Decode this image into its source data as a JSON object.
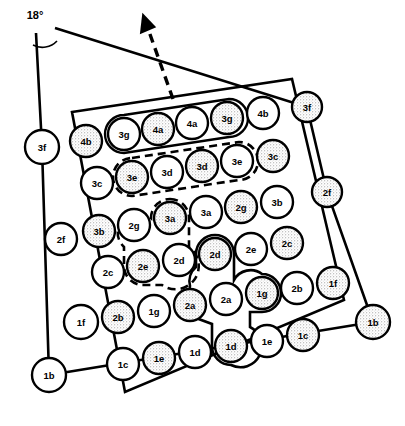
{
  "figure": {
    "annotations": {
      "angle_label": "18°",
      "angle_arc": "arc-between-frame-lines",
      "direction_arrow": "dashed-arrow-up-left"
    },
    "frame_nodes": [
      {
        "id": "frame-3f-left",
        "label": "3f",
        "cx": 42,
        "cy": 147,
        "r": 17,
        "shaded": false
      },
      {
        "id": "frame-2f-left",
        "label": "2f",
        "cx": 61,
        "cy": 239,
        "r": 16,
        "shaded": false
      },
      {
        "id": "frame-1b-left",
        "label": "1b",
        "cx": 49,
        "cy": 375,
        "r": 17,
        "shaded": false
      },
      {
        "id": "frame-3f-right",
        "label": "3f",
        "cx": 307,
        "cy": 107,
        "r": 15,
        "shaded": true
      },
      {
        "id": "frame-2f-right",
        "label": "2f",
        "cx": 327,
        "cy": 192,
        "r": 15,
        "shaded": true
      },
      {
        "id": "frame-1b-right",
        "label": "1b",
        "cx": 373,
        "cy": 322,
        "r": 17,
        "shaded": true
      }
    ],
    "grid_rows": [
      {
        "row": 1,
        "cells": [
          {
            "label": "4b",
            "cx": 86,
            "cy": 141,
            "r": 16,
            "shaded": true,
            "group": null
          },
          {
            "label": "3g",
            "cx": 124,
            "cy": 134,
            "r": 16,
            "shaded": false,
            "group": "solid-top"
          },
          {
            "label": "4a",
            "cx": 158,
            "cy": 129,
            "r": 16,
            "shaded": true,
            "group": "solid-top"
          },
          {
            "label": "4a",
            "cx": 192,
            "cy": 123,
            "r": 16,
            "shaded": false,
            "group": "solid-top"
          },
          {
            "label": "3g",
            "cx": 227,
            "cy": 118,
            "r": 16,
            "shaded": true,
            "group": "solid-top"
          },
          {
            "label": "4b",
            "cx": 263,
            "cy": 113,
            "r": 16,
            "shaded": false,
            "group": null
          }
        ]
      },
      {
        "row": 2,
        "cells": [
          {
            "label": "3c",
            "cx": 97,
            "cy": 183,
            "r": 16,
            "shaded": false,
            "group": null
          },
          {
            "label": "3e",
            "cx": 132,
            "cy": 177,
            "r": 16,
            "shaded": true,
            "group": "dashed-row2"
          },
          {
            "label": "3d",
            "cx": 167,
            "cy": 172,
            "r": 16,
            "shaded": false,
            "group": "dashed-row2"
          },
          {
            "label": "3d",
            "cx": 202,
            "cy": 166,
            "r": 16,
            "shaded": true,
            "group": "dashed-row2"
          },
          {
            "label": "3e",
            "cx": 237,
            "cy": 161,
            "r": 16,
            "shaded": false,
            "group": "dashed-row2"
          },
          {
            "label": "3c",
            "cx": 273,
            "cy": 156,
            "r": 16,
            "shaded": true,
            "group": null
          }
        ]
      },
      {
        "row": 3,
        "cells": [
          {
            "label": "3b",
            "cx": 99,
            "cy": 231,
            "r": 16,
            "shaded": true,
            "group": null
          },
          {
            "label": "2g",
            "cx": 134,
            "cy": 225,
            "r": 16,
            "shaded": false,
            "group": null
          },
          {
            "label": "3a",
            "cx": 170,
            "cy": 218,
            "r": 16,
            "shaded": true,
            "group": "dashed-mid"
          },
          {
            "label": "3a",
            "cx": 206,
            "cy": 212,
            "r": 16,
            "shaded": false,
            "group": null
          },
          {
            "label": "2g",
            "cx": 241,
            "cy": 207,
            "r": 16,
            "shaded": true,
            "group": null
          },
          {
            "label": "3b",
            "cx": 277,
            "cy": 202,
            "r": 16,
            "shaded": false,
            "group": null
          }
        ]
      },
      {
        "row": 4,
        "cells": [
          {
            "label": "2c",
            "cx": 108,
            "cy": 272,
            "r": 16,
            "shaded": false,
            "group": null
          },
          {
            "label": "2e",
            "cx": 143,
            "cy": 266,
            "r": 16,
            "shaded": true,
            "group": "dashed-mid"
          },
          {
            "label": "2d",
            "cx": 179,
            "cy": 260,
            "r": 16,
            "shaded": false,
            "group": null
          },
          {
            "label": "2d",
            "cx": 215,
            "cy": 254,
            "r": 16,
            "shaded": true,
            "group": "solid-cross"
          },
          {
            "label": "2e",
            "cx": 251,
            "cy": 249,
            "r": 16,
            "shaded": false,
            "group": null
          },
          {
            "label": "2c",
            "cx": 287,
            "cy": 243,
            "r": 16,
            "shaded": true,
            "group": null
          }
        ]
      },
      {
        "row": 5,
        "cells": [
          {
            "label": "1f",
            "cx": 81,
            "cy": 322,
            "r": 17,
            "shaded": false,
            "group": null
          },
          {
            "label": "2b",
            "cx": 118,
            "cy": 317,
            "r": 16,
            "shaded": true,
            "group": null
          },
          {
            "label": "1g",
            "cx": 154,
            "cy": 311,
            "r": 16,
            "shaded": false,
            "group": null
          },
          {
            "label": "2a",
            "cx": 190,
            "cy": 305,
            "r": 16,
            "shaded": true,
            "group": "solid-cross"
          },
          {
            "label": "2a",
            "cx": 226,
            "cy": 299,
            "r": 16,
            "shaded": false,
            "group": null
          },
          {
            "label": "1g",
            "cx": 262,
            "cy": 293,
            "r": 16,
            "shaded": true,
            "group": "solid-cross"
          },
          {
            "label": "2b",
            "cx": 297,
            "cy": 288,
            "r": 16,
            "shaded": false,
            "group": null
          },
          {
            "label": "1f",
            "cx": 333,
            "cy": 283,
            "r": 16,
            "shaded": true,
            "group": null
          }
        ]
      },
      {
        "row": 6,
        "cells": [
          {
            "label": "1c",
            "cx": 123,
            "cy": 364,
            "r": 16,
            "shaded": false,
            "group": null
          },
          {
            "label": "1e",
            "cx": 159,
            "cy": 358,
            "r": 16,
            "shaded": true,
            "group": null
          },
          {
            "label": "1d",
            "cx": 195,
            "cy": 352,
            "r": 16,
            "shaded": false,
            "group": null
          },
          {
            "label": "1d",
            "cx": 231,
            "cy": 346,
            "r": 16,
            "shaded": true,
            "group": "solid-cross"
          },
          {
            "label": "1e",
            "cx": 267,
            "cy": 341,
            "r": 16,
            "shaded": false,
            "group": null
          },
          {
            "label": "1c",
            "cx": 303,
            "cy": 335,
            "r": 16,
            "shaded": true,
            "group": null
          }
        ]
      }
    ],
    "groups": [
      {
        "id": "solid-top",
        "style": "solid",
        "members": [
          "3g",
          "4a",
          "4a",
          "3g"
        ]
      },
      {
        "id": "dashed-row2",
        "style": "dashed",
        "members": [
          "3e",
          "3d",
          "3d",
          "3e"
        ]
      },
      {
        "id": "dashed-mid",
        "style": "dashed",
        "members": [
          "3a",
          "2e"
        ]
      },
      {
        "id": "solid-cross",
        "style": "solid",
        "members": [
          "2d",
          "2a",
          "1g",
          "1d"
        ]
      }
    ],
    "colors": {
      "stroke": "#000000",
      "background": "#ffffff",
      "shade_fill": "#cfcfcf",
      "plain_fill": "#ffffff"
    }
  }
}
